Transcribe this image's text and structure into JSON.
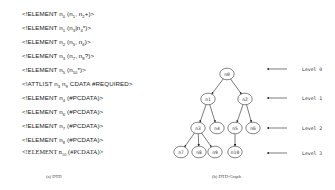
{
  "dtd": {
    "lines": [
      {
        "pre": "<!ELEMENT n",
        "parts": [
          [
            "sub",
            "0"
          ],
          [
            "t",
            " (n"
          ],
          [
            "sub",
            "1"
          ],
          [
            "t",
            ", n"
          ],
          [
            "sub",
            "2"
          ],
          [
            "t",
            "+)>"
          ]
        ]
      },
      {
        "pre": "<!ELEMENT n",
        "parts": [
          [
            "sub",
            "1"
          ],
          [
            "t",
            " (n"
          ],
          [
            "sub",
            "3"
          ],
          [
            "t",
            "|n"
          ],
          [
            "sub",
            "4"
          ],
          [
            "t",
            "*)>"
          ]
        ]
      },
      {
        "pre": "<!ELEMENT n",
        "parts": [
          [
            "sub",
            "2"
          ],
          [
            "t",
            " (n"
          ],
          [
            "sub",
            "5"
          ],
          [
            "t",
            ", n"
          ],
          [
            "sub",
            "6"
          ],
          [
            "t",
            ")>"
          ]
        ]
      },
      {
        "pre": "<!ELEMENT n",
        "parts": [
          [
            "sub",
            "3"
          ],
          [
            "t",
            " (n"
          ],
          [
            "sub",
            "7"
          ],
          [
            "t",
            ", n"
          ],
          [
            "sub",
            "8"
          ],
          [
            "t",
            "?)>"
          ]
        ]
      },
      {
        "pre": "<!ELEMENT n",
        "parts": [
          [
            "sub",
            "5"
          ],
          [
            "t",
            " (n"
          ],
          [
            "sub",
            "10"
          ],
          [
            "t",
            "*)>"
          ]
        ]
      },
      {
        "pre": "<!ATTLIST n",
        "parts": [
          [
            "sub",
            "3"
          ],
          [
            "t",
            " n"
          ],
          [
            "sub",
            "9"
          ],
          [
            "t",
            " CDATA #REQUIRED>"
          ]
        ]
      },
      {
        "pre": "<!ELEMENT n",
        "parts": [
          [
            "sub",
            "4"
          ],
          [
            "t",
            " (#PCDATA)>"
          ]
        ]
      },
      {
        "pre": "<!ELEMENT n",
        "parts": [
          [
            "sub",
            "6"
          ],
          [
            "t",
            " (#PCDATA)>"
          ]
        ]
      },
      {
        "pre": "<!ELEMENT n",
        "parts": [
          [
            "sub",
            "7"
          ],
          [
            "t",
            " (#PCDATA)>"
          ]
        ]
      },
      {
        "pre": "<!ELEMENT n",
        "parts": [
          [
            "sub",
            "8"
          ],
          [
            "t",
            " (#PCDATA)>"
          ]
        ]
      },
      {
        "pre": "<!ELEMENT n",
        "parts": [
          [
            "sub",
            "10"
          ],
          [
            "t",
            " (#PCDATA)>"
          ]
        ]
      }
    ],
    "caption": "(a) DTD"
  },
  "graph": {
    "caption": "(b) DTD-Graph",
    "nodes": [
      {
        "id": "n0",
        "x": 227,
        "y": 74
      },
      {
        "id": "n1",
        "x": 208,
        "y": 99
      },
      {
        "id": "n2",
        "x": 245,
        "y": 99
      },
      {
        "id": "n3",
        "x": 198,
        "y": 128
      },
      {
        "id": "n4",
        "x": 217,
        "y": 128
      },
      {
        "id": "n5",
        "x": 235,
        "y": 128
      },
      {
        "id": "n6",
        "x": 253,
        "y": 128
      },
      {
        "id": "n7",
        "x": 181,
        "y": 152
      },
      {
        "id": "n8",
        "x": 199,
        "y": 152
      },
      {
        "id": "n9",
        "x": 215,
        "y": 152
      },
      {
        "id": "n10",
        "x": 235,
        "y": 152
      }
    ],
    "edges": [
      [
        "n0",
        "n1"
      ],
      [
        "n0",
        "n2"
      ],
      [
        "n1",
        "n3"
      ],
      [
        "n1",
        "n4"
      ],
      [
        "n2",
        "n5"
      ],
      [
        "n2",
        "n6"
      ],
      [
        "n3",
        "n7"
      ],
      [
        "n3",
        "n8"
      ],
      [
        "n3",
        "n9"
      ],
      [
        "n5",
        "n10"
      ]
    ],
    "levels": [
      {
        "label": "Level 0",
        "y": 69
      },
      {
        "label": "Level 1",
        "y": 98
      },
      {
        "label": "Level 2",
        "y": 128
      },
      {
        "label": "Level 3",
        "y": 153
      }
    ]
  }
}
